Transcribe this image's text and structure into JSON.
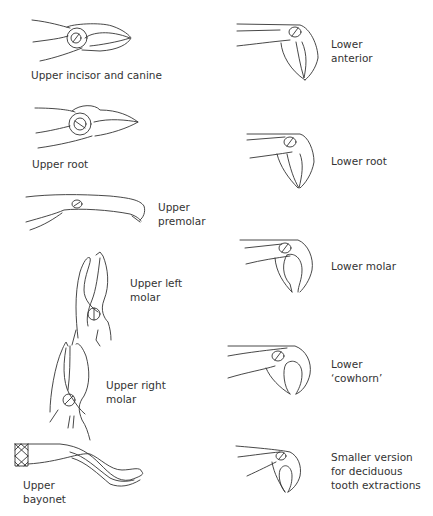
{
  "figure": {
    "instruments": [
      {
        "id": "upper-incisor-canine",
        "label_lines": [
          "Upper incisor and canine"
        ],
        "jaw": "upper",
        "column": "left"
      },
      {
        "id": "upper-root",
        "label_lines": [
          "Upper root"
        ],
        "jaw": "upper",
        "column": "left"
      },
      {
        "id": "upper-premolar",
        "label_lines": [
          "Upper",
          "premolar"
        ],
        "jaw": "upper",
        "column": "left"
      },
      {
        "id": "upper-left-molar",
        "label_lines": [
          "Upper left",
          "molar"
        ],
        "jaw": "upper",
        "column": "left"
      },
      {
        "id": "upper-right-molar",
        "label_lines": [
          "Upper right",
          "molar"
        ],
        "jaw": "upper",
        "column": "left"
      },
      {
        "id": "upper-bayonet",
        "label_lines": [
          "Upper",
          "bayonet"
        ],
        "jaw": "upper",
        "column": "left"
      },
      {
        "id": "lower-anterior",
        "label_lines": [
          "Lower",
          "anterior"
        ],
        "jaw": "lower",
        "column": "right"
      },
      {
        "id": "lower-root",
        "label_lines": [
          "Lower root"
        ],
        "jaw": "lower",
        "column": "right"
      },
      {
        "id": "lower-molar",
        "label_lines": [
          "Lower molar"
        ],
        "jaw": "lower",
        "column": "right"
      },
      {
        "id": "lower-cowhorn",
        "label_lines": [
          "Lower",
          "‘cowhorn’"
        ],
        "jaw": "lower",
        "column": "right"
      },
      {
        "id": "lower-deciduous",
        "label_lines": [
          "Smaller version",
          "for deciduous",
          "tooth extractions"
        ],
        "jaw": "lower",
        "column": "right"
      }
    ],
    "line_color": "#333333",
    "background": "#ffffff"
  }
}
